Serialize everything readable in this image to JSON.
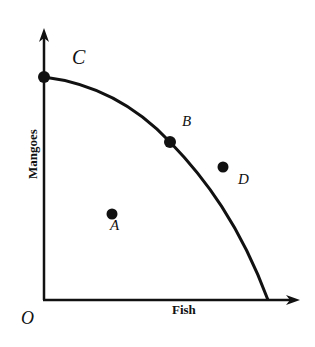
{
  "diagram": {
    "type": "production-possibilities-frontier",
    "origin_label": "O",
    "x_axis_label": "Fish",
    "y_axis_label": "Mangoes",
    "points": [
      {
        "label": "C",
        "position": "on frontier, y-intercept"
      },
      {
        "label": "B",
        "position": "on frontier"
      },
      {
        "label": "D",
        "position": "outside frontier"
      },
      {
        "label": "A",
        "position": "inside frontier"
      }
    ]
  },
  "colors": {
    "ink": "#111111",
    "background": "#ffffff"
  }
}
